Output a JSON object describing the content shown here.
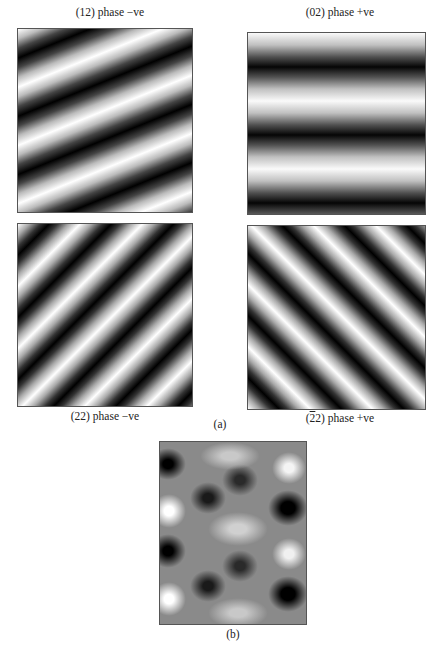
{
  "figure": {
    "part_a_label": "(a)",
    "part_b_label": "(b)",
    "panels": [
      {
        "id": "12",
        "caption": "(12) phase −ve",
        "orientation": "oblique bands, shallow slope"
      },
      {
        "id": "02",
        "caption": "(02) phase +ve",
        "orientation": "horizontal bands"
      },
      {
        "id": "22",
        "caption": "(22) phase −ve",
        "orientation": "diagonal bands, down-right"
      },
      {
        "id": "-22",
        "caption_prefix": "(",
        "caption_bar": "2",
        "caption_suffix": "2) phase +ve",
        "orientation": "diagonal bands, up-right"
      }
    ],
    "superposition": {
      "caption": "(b)",
      "description": "sum of four Fourier components"
    }
  }
}
